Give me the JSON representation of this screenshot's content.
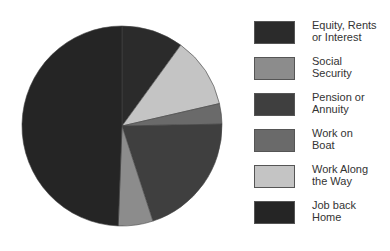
{
  "chart_data": {
    "type": "pie",
    "title": "",
    "start_angle_deg": 0,
    "direction": "clockwise",
    "legend_position": "right",
    "slices": [
      {
        "label": "Equity, Rents or Interest",
        "value": 10.0,
        "color": "#2b2b2b"
      },
      {
        "label": "Work Along the Way",
        "value": 11.4,
        "color": "#c4c4c4"
      },
      {
        "label": "Work on Boat",
        "value": 3.3,
        "color": "#6a6a6a"
      },
      {
        "label": "Pension or Annuity",
        "value": 20.3,
        "color": "#3f3f3f"
      },
      {
        "label": "Social Security",
        "value": 5.6,
        "color": "#8c8c8c"
      },
      {
        "label": "Job back Home",
        "value": 49.4,
        "color": "#252525"
      }
    ],
    "legend": [
      {
        "label": "Equity, Rents or Interest",
        "line1": "Equity, Rents",
        "line2": "or Interest",
        "color": "#2b2b2b"
      },
      {
        "label": "Social Security",
        "line1": "Social",
        "line2": "Security",
        "color": "#8c8c8c"
      },
      {
        "label": "Pension or Annuity",
        "line1": "Pension or",
        "line2": "Annuity",
        "color": "#3f3f3f"
      },
      {
        "label": "Work on Boat",
        "line1": "Work on",
        "line2": "Boat",
        "color": "#6a6a6a"
      },
      {
        "label": "Work Along the Way",
        "line1": "Work Along",
        "line2": "the Way",
        "color": "#c4c4c4"
      },
      {
        "label": "Job back Home",
        "line1": "Job back",
        "line2": "Home",
        "color": "#252525"
      }
    ]
  },
  "layout": {
    "cx": 122,
    "cy": 126,
    "r": 100
  }
}
